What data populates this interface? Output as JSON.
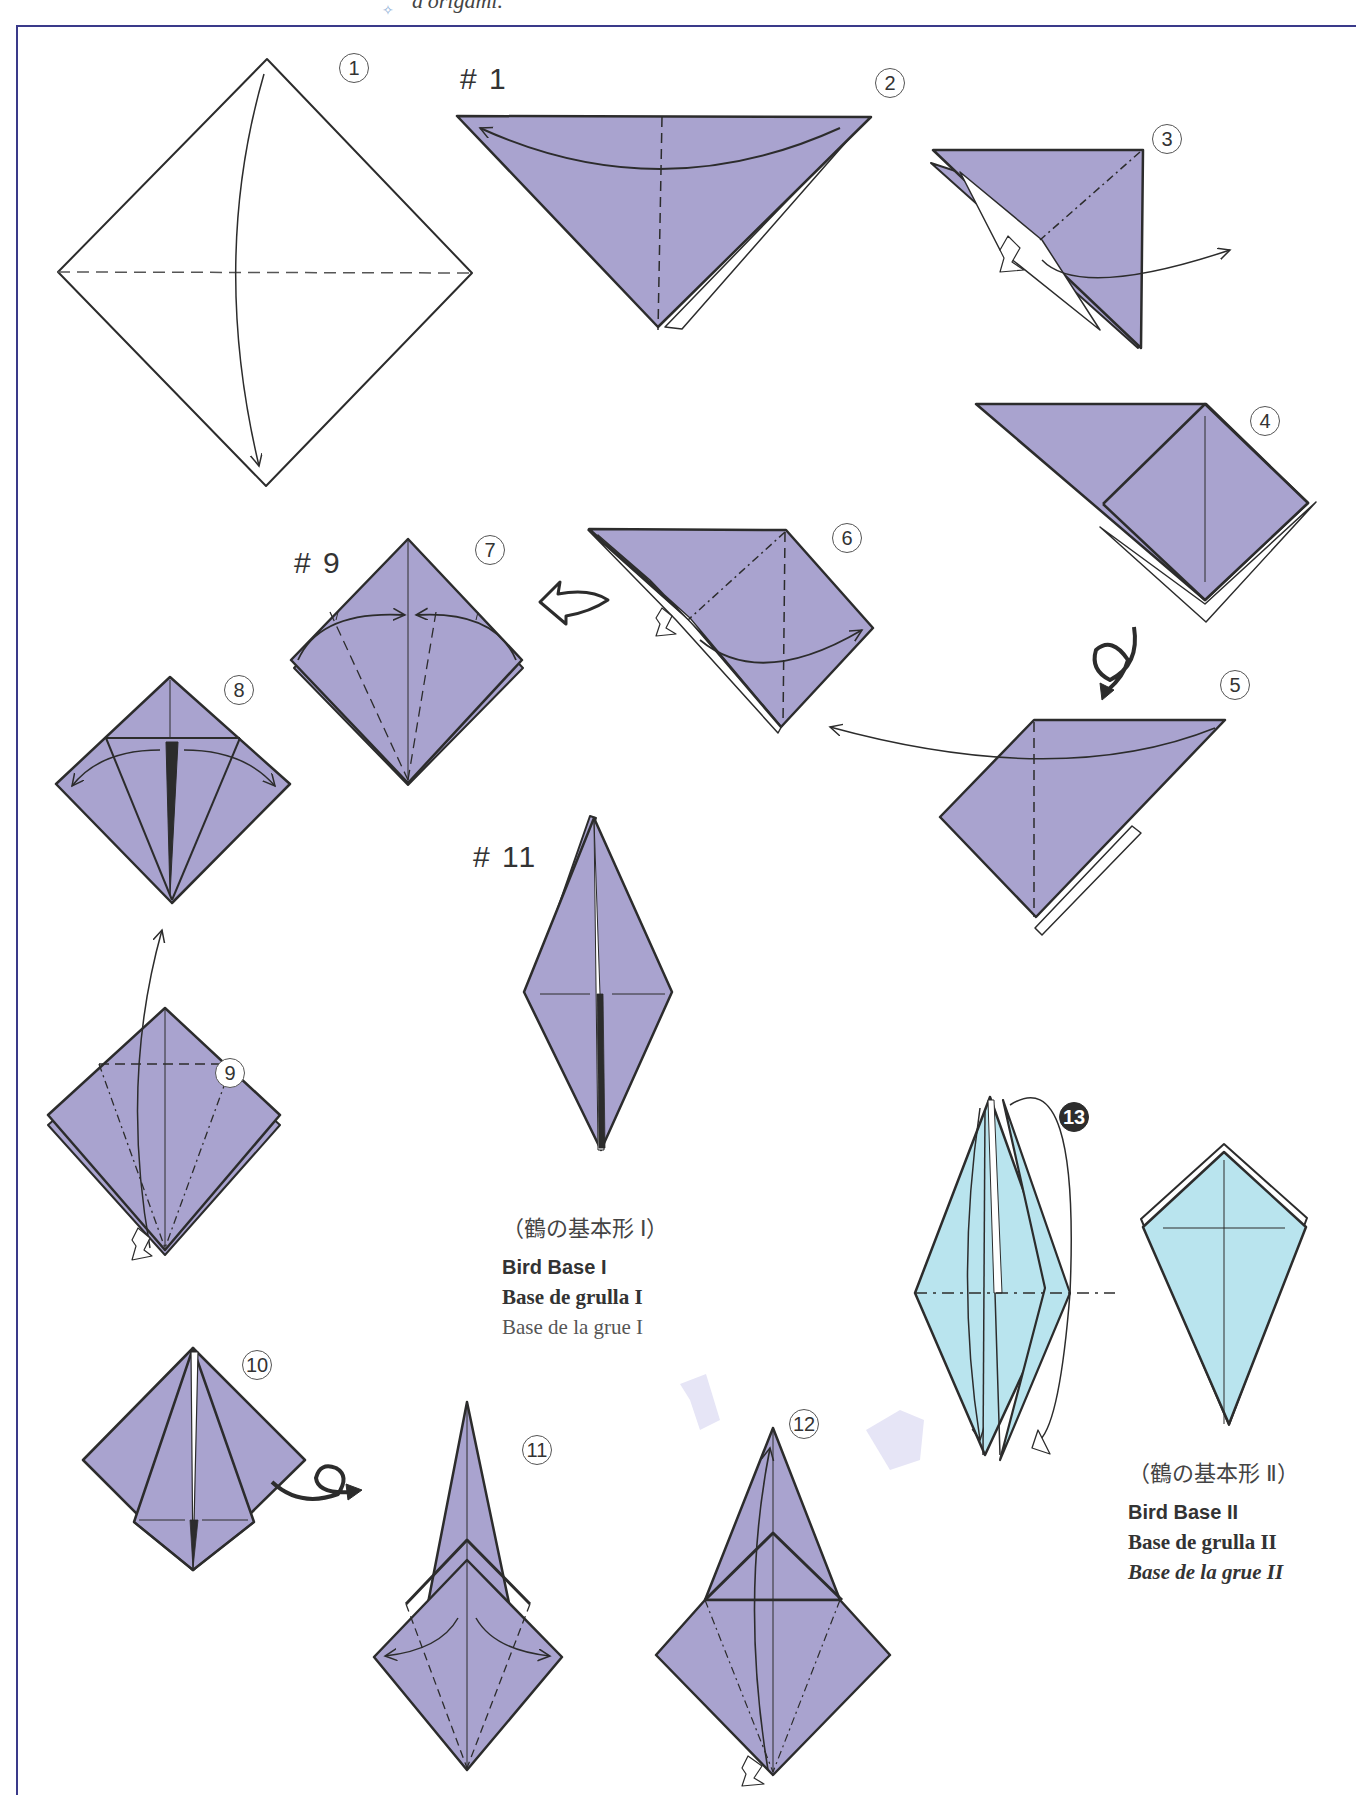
{
  "header": {
    "text": "d'origami."
  },
  "colors": {
    "paper_front": "#a9a3cf",
    "paper_blue": "#b9e4ee",
    "line": "#2c2c2c",
    "frame": "#3a3a8a"
  },
  "ref_labels": [
    "# 1",
    "# 9",
    "# 11"
  ],
  "steps": [
    {
      "n": "1"
    },
    {
      "n": "2"
    },
    {
      "n": "3"
    },
    {
      "n": "4"
    },
    {
      "n": "5"
    },
    {
      "n": "6"
    },
    {
      "n": "7"
    },
    {
      "n": "8"
    },
    {
      "n": "9"
    },
    {
      "n": "10"
    },
    {
      "n": "11"
    },
    {
      "n": "12"
    },
    {
      "n": "13"
    }
  ],
  "captions": {
    "bird_base_1": {
      "jp": "（鶴の基本形 Ⅰ）",
      "en": "Bird Base I",
      "es": "Base de grulla I",
      "fr": "Base de la grue I"
    },
    "bird_base_2": {
      "jp": "（鶴の基本形 Ⅱ）",
      "en": "Bird Base II",
      "es": "Base de grulla II",
      "fr": "Base de la grue II"
    }
  }
}
